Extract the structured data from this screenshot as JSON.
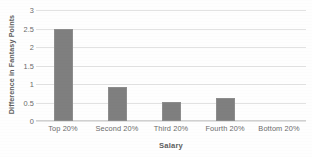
{
  "chart_data": {
    "type": "bar",
    "title": "",
    "xlabel": "Salary",
    "ylabel": "Difference in Fantasy Points",
    "categories": [
      "Top 20%",
      "Second 20%",
      "Third 20%",
      "Fourth 20%",
      "Bottom 20%"
    ],
    "values": [
      2.5,
      0.92,
      0.51,
      0.62,
      0
    ],
    "ylim": [
      0,
      3
    ],
    "yticks": [
      0,
      0.5,
      1,
      1.5,
      2,
      2.5,
      3
    ],
    "ytick_labels": [
      "0",
      "0.5",
      "1",
      "1.5",
      "2",
      "2.5",
      "3"
    ],
    "grid": true,
    "legend": false,
    "bar_color": "#7f7f7f",
    "gridline_color": "#e2e2e2",
    "background_color": "#fefefe"
  }
}
